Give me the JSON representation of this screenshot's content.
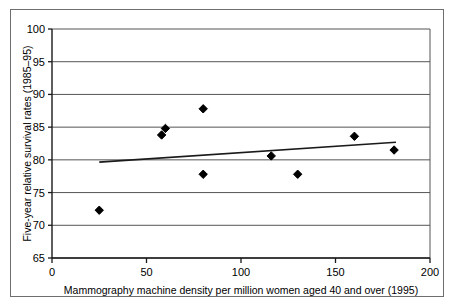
{
  "chart_data": {
    "type": "scatter",
    "title": "",
    "xlabel": "Mammography machine density per million women aged 40 and over (1995)",
    "ylabel": "Five-year relative survival rates (1985–95)",
    "xlim": [
      0,
      200
    ],
    "ylim": [
      65,
      100
    ],
    "xticks": [
      0,
      50,
      100,
      150,
      200
    ],
    "yticks": [
      65,
      70,
      75,
      80,
      85,
      90,
      95,
      100
    ],
    "xtick_labels": [
      "0",
      "50",
      "100",
      "150",
      "200"
    ],
    "ytick_labels": [
      "65",
      "70",
      "75",
      "80",
      "85",
      "90",
      "95",
      "100"
    ],
    "grid": "horizontal",
    "legend": "none",
    "marker": "diamond",
    "marker_color": "#000000",
    "points": [
      {
        "x": 25,
        "y": 72.3
      },
      {
        "x": 58,
        "y": 83.8
      },
      {
        "x": 60,
        "y": 84.8
      },
      {
        "x": 80,
        "y": 87.8
      },
      {
        "x": 80,
        "y": 77.8
      },
      {
        "x": 116,
        "y": 80.6
      },
      {
        "x": 130,
        "y": 77.8
      },
      {
        "x": 160,
        "y": 83.6
      },
      {
        "x": 181,
        "y": 81.5
      }
    ],
    "trendline": {
      "type": "linear",
      "color": "#1a1a1a",
      "x_start": 25,
      "y_start": 79.65,
      "x_end": 182,
      "y_end": 82.7
    }
  },
  "style": {
    "frame_color": "#6e6e6e",
    "axis_color": "#1a1a1a",
    "gridline_color": "#555555",
    "background": "#ffffff"
  }
}
